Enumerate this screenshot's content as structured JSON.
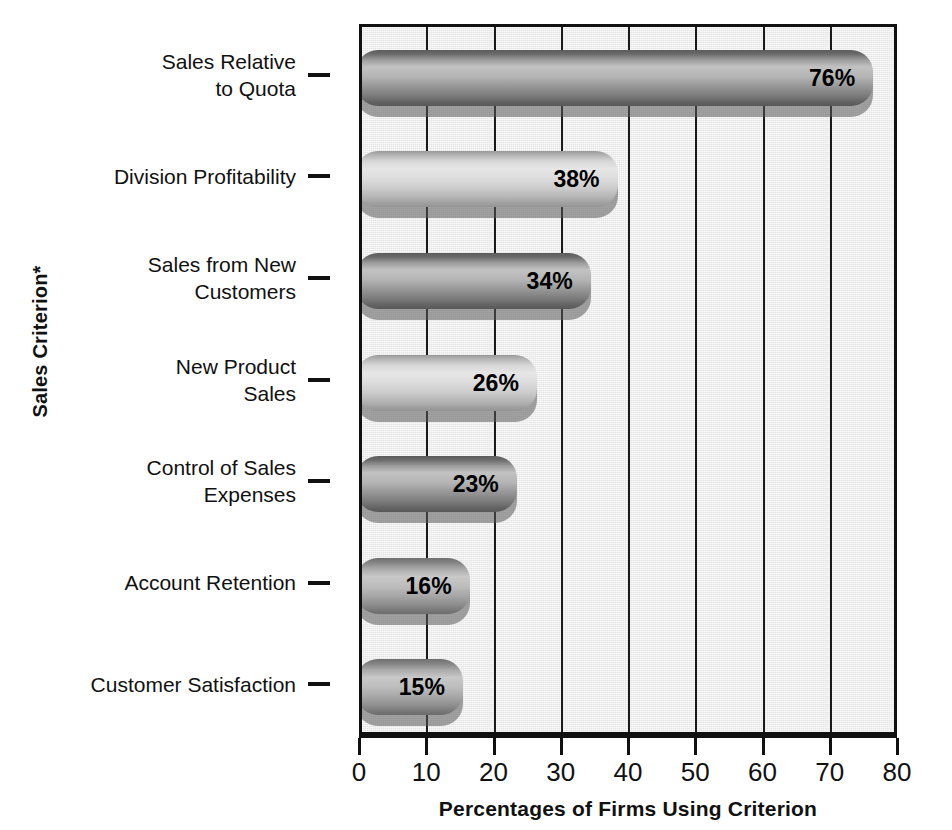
{
  "chart_data": {
    "type": "bar",
    "orientation": "horizontal",
    "title": "",
    "xlabel": "Percentages of Firms Using Criterion",
    "ylabel": "Sales Criterion*",
    "xlim": [
      0,
      80
    ],
    "xticks": [
      0,
      10,
      20,
      30,
      40,
      50,
      60,
      70,
      80
    ],
    "xtick_labels": [
      "0",
      "10",
      "20",
      "30",
      "40",
      "50",
      "60",
      "70",
      "80"
    ],
    "grid": true,
    "grid_axis": "x",
    "legend": "none",
    "categories": [
      "Sales Relative\nto Quota",
      "Division Profitability",
      "Sales from New\nCustomers",
      "New Product\nSales",
      "Control of Sales\nExpenses",
      "Account Retention",
      "Customer Satisfaction"
    ],
    "values": [
      76,
      38,
      34,
      26,
      23,
      16,
      15
    ],
    "value_labels": [
      "76%",
      "38%",
      "34%",
      "26%",
      "23%",
      "16%",
      "15%"
    ]
  },
  "axes": {
    "y_title": "Sales Criterion*",
    "x_title": "Percentages of Firms Using Criterion"
  },
  "colors": {
    "plot_background": "#e4e4e4",
    "axis": "#111111",
    "bar_dark_top": "#6e6e6e",
    "bar_light_mid": "#d8d8d8",
    "bar_shadow": "#8f8f8f",
    "value_text": "#000000"
  },
  "bars": [
    {
      "label": "Sales Relative\nto Quota",
      "value": 76,
      "value_label": "76%",
      "tone": "dark"
    },
    {
      "label": "Division Profitability",
      "value": 38,
      "value_label": "38%",
      "tone": "light"
    },
    {
      "label": "Sales from New\nCustomers",
      "value": 34,
      "value_label": "34%",
      "tone": "dark"
    },
    {
      "label": "New Product\nSales",
      "value": 26,
      "value_label": "26%",
      "tone": "light"
    },
    {
      "label": "Control of Sales\nExpenses",
      "value": 23,
      "value_label": "23%",
      "tone": "dark"
    },
    {
      "label": "Account Retention",
      "value": 16,
      "value_label": "16%",
      "tone": "mid"
    },
    {
      "label": "Customer Satisfaction",
      "value": 15,
      "value_label": "15%",
      "tone": "mid"
    }
  ]
}
